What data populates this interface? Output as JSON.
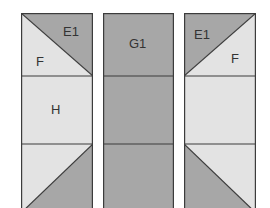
{
  "colors": {
    "dark": "#a7a7a7",
    "light": "#e3e3e3",
    "stroke": "#3c3c3c",
    "background": "#ffffff"
  },
  "panels": [
    {
      "id": "left",
      "blocks": [
        {
          "shape": "half-square triangle, diagonal top-left to bottom-right",
          "dark_piece": "E1",
          "light_piece": "F"
        },
        {
          "shape": "rectangle",
          "piece": "H"
        },
        {
          "shape": "half-square triangle, diagonal bottom-left to top-right",
          "dark_piece": "",
          "light_piece": ""
        }
      ],
      "labels": {
        "e1": "E1",
        "f": "F",
        "h": "H"
      }
    },
    {
      "id": "middle",
      "blocks": [
        {
          "shape": "rectangle",
          "piece": "G1"
        },
        {
          "shape": "rectangle",
          "piece": ""
        },
        {
          "shape": "rectangle",
          "piece": ""
        }
      ],
      "labels": {
        "g1": "G1"
      }
    },
    {
      "id": "right",
      "blocks": [
        {
          "shape": "half-square triangle, diagonal bottom-left to top-right",
          "dark_piece": "E1",
          "light_piece": "F"
        },
        {
          "shape": "rectangle",
          "piece": ""
        },
        {
          "shape": "half-square triangle, diagonal top-left to bottom-right",
          "dark_piece": "",
          "light_piece": ""
        }
      ],
      "labels": {
        "e1": "E1",
        "f": "F"
      }
    }
  ]
}
